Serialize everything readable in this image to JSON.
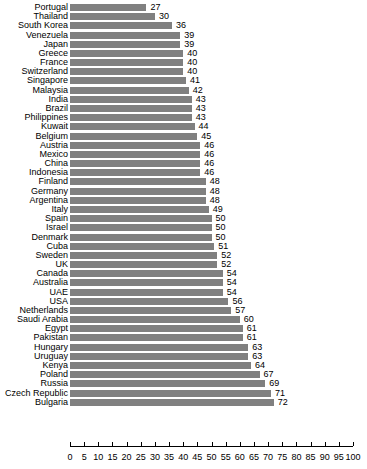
{
  "chart_data": {
    "type": "bar",
    "orientation": "horizontal",
    "title": "",
    "subtitle": "",
    "xlabel": "",
    "ylabel": "",
    "xlim": [
      0,
      100
    ],
    "xticks": [
      0,
      5,
      10,
      15,
      20,
      25,
      30,
      35,
      40,
      45,
      50,
      55,
      60,
      65,
      70,
      75,
      80,
      85,
      90,
      95,
      100
    ],
    "grid": false,
    "legend": null,
    "bar_color": "#808080",
    "value_labels_shown": true,
    "categories": [
      "Portugal",
      "Thailand",
      "South Korea",
      "Venezuela",
      "Japan",
      "Greece",
      "France",
      "Switzerland",
      "Singapore",
      "Malaysia",
      "India",
      "Brazil",
      "Philippines",
      "Kuwait",
      "Belgium",
      "Austria",
      "Mexico",
      "China",
      "Indonesia",
      "Finland",
      "Germany",
      "Argentina",
      "Italy",
      "Spain",
      "Israel",
      "Denmark",
      "Cuba",
      "Sweden",
      "UK",
      "Canada",
      "Australia",
      "UAE",
      "USA",
      "Netherlands",
      "Saudi Arabia",
      "Egypt",
      "Pakistan",
      "Hungary",
      "Uruguay",
      "Kenya",
      "Poland",
      "Russia",
      "Czech Republic",
      "Bulgaria"
    ],
    "values": [
      27,
      30,
      36,
      39,
      39,
      40,
      40,
      40,
      41,
      42,
      43,
      43,
      43,
      44,
      45,
      46,
      46,
      46,
      46,
      48,
      48,
      48,
      49,
      50,
      50,
      50,
      51,
      52,
      52,
      54,
      54,
      54,
      56,
      57,
      60,
      61,
      61,
      63,
      63,
      64,
      67,
      69,
      71,
      72
    ]
  }
}
